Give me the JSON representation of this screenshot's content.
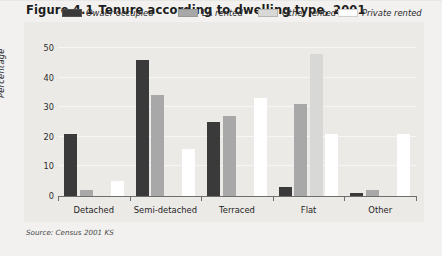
{
  "figure": {
    "number": "Figure 4.1",
    "title": "Tenure according to dwelling type, 2001",
    "source": "Source: Census 2001 KS"
  },
  "colors": {
    "owner_occupied": "#3a3a3a",
    "la_rented": "#a8a8a8",
    "other_rented": "#d8d8d6",
    "private_rented": "#ffffff",
    "panel_bg": "#eceae7",
    "page_bg": "#f2f1ef",
    "axis": "#6d6d6d",
    "gridline": "#f7f6f4",
    "text": "#1d1d1d"
  },
  "chart_data": {
    "type": "bar",
    "title": "Tenure according to dwelling type, 2001",
    "xlabel": "",
    "ylabel": "Percentage",
    "ylim": [
      0,
      50
    ],
    "yticks": [
      0,
      10,
      20,
      30,
      40,
      50
    ],
    "ytick_labels": [
      "0",
      "10",
      "20",
      "30",
      "40",
      "50"
    ],
    "grid": true,
    "legend_position": "top",
    "categories": [
      "Detached",
      "Semi-detached",
      "Terraced",
      "Flat",
      "Other"
    ],
    "series": [
      {
        "name": "Owaer occupied",
        "color": "#3a3a3a",
        "values": [
          21,
          46,
          25,
          3,
          1
        ]
      },
      {
        "name": "LA rented",
        "color": "#a8a8a8",
        "values": [
          2,
          34,
          27,
          31,
          2
        ]
      },
      {
        "name": "Other rented",
        "color": "#d8d8d6",
        "values": [
          0,
          0,
          0,
          48,
          0
        ]
      },
      {
        "name": "Private rented",
        "color": "#ffffff",
        "values": [
          5,
          16,
          33,
          21,
          21
        ]
      }
    ]
  }
}
